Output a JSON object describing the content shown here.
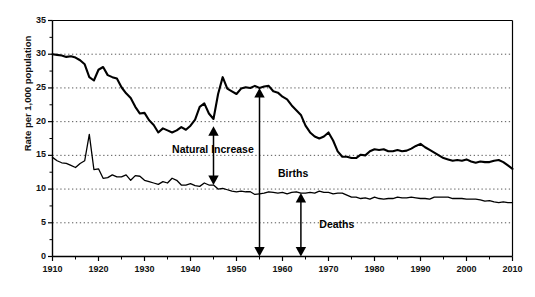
{
  "chart_data": {
    "type": "line",
    "title": "",
    "subtitle": "",
    "xlabel": "",
    "ylabel": "Rate per 1,000 population",
    "xlim": [
      1910,
      2010
    ],
    "ylim": [
      0,
      35
    ],
    "grid": true,
    "grid_style": "dotted-horizontal",
    "legend": "none",
    "y_ticks": [
      0,
      5,
      10,
      15,
      20,
      25,
      30,
      35
    ],
    "y_tick_labels": [
      "0",
      "5",
      "10",
      "15",
      "20",
      "25",
      "30",
      "35"
    ],
    "x_ticks": [
      1910,
      1920,
      1930,
      1940,
      1950,
      1960,
      1970,
      1980,
      1990,
      2000,
      2010
    ],
    "x_tick_labels": [
      "1910",
      "1920",
      "1930",
      "1940",
      "1950",
      "1960",
      "1970",
      "1980",
      "1990",
      "2000",
      "2010"
    ],
    "x_minor_tick_interval": 5,
    "y_minor_tick_interval": 5,
    "series": [
      {
        "name": "Births",
        "color": "#000000",
        "line_width": 2.1,
        "x": [
          1910,
          1911,
          1912,
          1913,
          1914,
          1915,
          1916,
          1917,
          1918,
          1919,
          1920,
          1921,
          1922,
          1923,
          1924,
          1925,
          1926,
          1927,
          1928,
          1929,
          1930,
          1931,
          1932,
          1933,
          1934,
          1935,
          1936,
          1937,
          1938,
          1939,
          1940,
          1941,
          1942,
          1943,
          1944,
          1945,
          1946,
          1947,
          1948,
          1949,
          1950,
          1951,
          1952,
          1953,
          1954,
          1955,
          1956,
          1957,
          1958,
          1959,
          1960,
          1961,
          1962,
          1963,
          1964,
          1965,
          1966,
          1967,
          1968,
          1969,
          1970,
          1971,
          1972,
          1973,
          1974,
          1975,
          1976,
          1977,
          1978,
          1979,
          1980,
          1981,
          1982,
          1983,
          1984,
          1985,
          1986,
          1987,
          1988,
          1989,
          1990,
          1991,
          1992,
          1993,
          1994,
          1995,
          1996,
          1997,
          1998,
          1999,
          2000,
          2001,
          2002,
          2003,
          2004,
          2005,
          2006,
          2007,
          2008,
          2009,
          2010
        ],
        "y": [
          30.0,
          29.9,
          29.8,
          29.6,
          29.7,
          29.5,
          29.1,
          28.5,
          26.6,
          26.1,
          27.7,
          28.1,
          26.9,
          26.6,
          26.4,
          25.1,
          24.2,
          23.5,
          22.2,
          21.2,
          21.3,
          20.2,
          19.5,
          18.4,
          19.0,
          18.7,
          18.4,
          18.7,
          19.2,
          18.8,
          19.4,
          20.3,
          22.2,
          22.7,
          21.2,
          20.4,
          24.1,
          26.6,
          24.9,
          24.5,
          24.1,
          24.9,
          25.1,
          25.0,
          25.3,
          25.0,
          25.2,
          25.3,
          24.5,
          24.3,
          23.7,
          23.3,
          22.4,
          21.7,
          21.0,
          19.4,
          18.4,
          17.8,
          17.5,
          17.8,
          18.4,
          17.2,
          15.6,
          14.8,
          14.8,
          14.6,
          14.6,
          15.1,
          15.0,
          15.6,
          15.9,
          15.8,
          15.9,
          15.6,
          15.6,
          15.8,
          15.6,
          15.7,
          16.0,
          16.4,
          16.7,
          16.2,
          15.8,
          15.4,
          15.0,
          14.6,
          14.4,
          14.2,
          14.3,
          14.2,
          14.4,
          14.1,
          13.9,
          14.1,
          14.0,
          14.0,
          14.2,
          14.3,
          14.0,
          13.5,
          13.0
        ]
      },
      {
        "name": "Deaths",
        "color": "#000000",
        "line_width": 1.3,
        "x": [
          1910,
          1911,
          1912,
          1913,
          1914,
          1915,
          1916,
          1917,
          1918,
          1919,
          1920,
          1921,
          1922,
          1923,
          1924,
          1925,
          1926,
          1927,
          1928,
          1929,
          1930,
          1931,
          1932,
          1933,
          1934,
          1935,
          1936,
          1937,
          1938,
          1939,
          1940,
          1941,
          1942,
          1943,
          1944,
          1945,
          1946,
          1947,
          1948,
          1949,
          1950,
          1951,
          1952,
          1953,
          1954,
          1955,
          1956,
          1957,
          1958,
          1959,
          1960,
          1961,
          1962,
          1963,
          1964,
          1965,
          1966,
          1967,
          1968,
          1969,
          1970,
          1971,
          1972,
          1973,
          1974,
          1975,
          1976,
          1977,
          1978,
          1979,
          1980,
          1981,
          1982,
          1983,
          1984,
          1985,
          1986,
          1987,
          1988,
          1989,
          1990,
          1991,
          1992,
          1993,
          1994,
          1995,
          1996,
          1997,
          1998,
          1999,
          2000,
          2001,
          2002,
          2003,
          2004,
          2005,
          2006,
          2007,
          2008,
          2009,
          2010
        ],
        "y": [
          14.7,
          14.2,
          13.9,
          13.8,
          13.5,
          13.2,
          13.8,
          14.2,
          18.1,
          12.9,
          13.0,
          11.6,
          11.7,
          12.1,
          11.8,
          11.8,
          12.1,
          11.3,
          12.0,
          11.9,
          11.3,
          11.1,
          10.9,
          10.7,
          11.1,
          10.9,
          11.6,
          11.3,
          10.6,
          10.6,
          10.8,
          10.5,
          10.4,
          10.9,
          10.6,
          10.6,
          10.0,
          10.1,
          9.9,
          9.7,
          9.6,
          9.7,
          9.6,
          9.6,
          9.2,
          9.3,
          9.4,
          9.6,
          9.5,
          9.4,
          9.5,
          9.3,
          9.5,
          9.6,
          9.4,
          9.4,
          9.5,
          9.4,
          9.7,
          9.5,
          9.5,
          9.3,
          9.4,
          9.4,
          9.1,
          8.8,
          8.8,
          8.6,
          8.7,
          8.5,
          8.8,
          8.6,
          8.5,
          8.6,
          8.6,
          8.8,
          8.7,
          8.7,
          8.8,
          8.7,
          8.6,
          8.6,
          8.5,
          8.8,
          8.8,
          8.8,
          8.8,
          8.6,
          8.6,
          8.6,
          8.5,
          8.5,
          8.5,
          8.4,
          8.2,
          8.3,
          8.1,
          8.0,
          8.1,
          8.0,
          8.0
        ]
      }
    ],
    "annotations": [
      {
        "name": "natural-increase",
        "label": "Natural Increase",
        "type": "double-headed-arrow",
        "x": 1945,
        "y_top": 19.3,
        "y_bottom": 10.6,
        "label_x": 1936,
        "label_y": 15.8
      },
      {
        "name": "births",
        "label": "Births",
        "type": "double-headed-arrow",
        "x": 1955,
        "y_top": 25.0,
        "y_bottom": 0,
        "label_x": 1959,
        "label_y": 12.2
      },
      {
        "name": "deaths",
        "label": "Deaths",
        "type": "double-headed-arrow",
        "x": 1964,
        "y_top": 9.4,
        "y_bottom": 0,
        "label_x": 1968,
        "label_y": 4.6
      }
    ]
  }
}
